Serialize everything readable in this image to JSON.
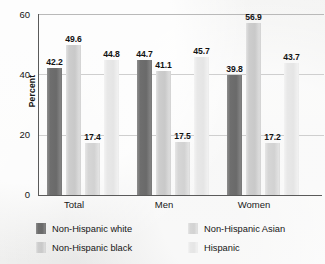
{
  "chart_data": {
    "type": "bar",
    "title": "",
    "xlabel": "",
    "ylabel": "Percent",
    "ylim": [
      0,
      60
    ],
    "yticks": [
      "0",
      "20",
      "40",
      "60"
    ],
    "grid": true,
    "legend_position": "bottom",
    "categories": [
      "Total",
      "Men",
      "Women"
    ],
    "series": [
      {
        "name": "Non-Hispanic white",
        "color": "#6e6e6e",
        "values": [
          42.2,
          44.7,
          39.8
        ]
      },
      {
        "name": "Non-Hispanic black",
        "color": "#cdcdcd",
        "values": [
          49.6,
          41.1,
          56.9
        ]
      },
      {
        "name": "Non-Hispanic Asian",
        "color": "#d6d6d6",
        "values": [
          17.4,
          17.5,
          17.2
        ]
      },
      {
        "name": "Hispanic",
        "color": "#e8e8e8",
        "values": [
          44.8,
          45.7,
          43.7
        ]
      }
    ],
    "data_labels": [
      [
        "42.2",
        "49.6",
        "17.4",
        "44.8"
      ],
      [
        "44.7",
        "41.1",
        "17.5",
        "45.7"
      ],
      [
        "39.8",
        "56.9",
        "17.2",
        "43.7"
      ]
    ]
  },
  "axis": {
    "y_title": "Percent",
    "y_tick_0": "0",
    "y_tick_20": "20",
    "y_tick_40": "40",
    "y_tick_60": "60"
  },
  "categories": {
    "c0": "Total",
    "c1": "Men",
    "c2": "Women"
  },
  "legend": {
    "e0": "Non-Hispanic white",
    "e1": "Non-Hispanic Asian",
    "e2": "Non-Hispanic black",
    "e3": "Hispanic"
  }
}
